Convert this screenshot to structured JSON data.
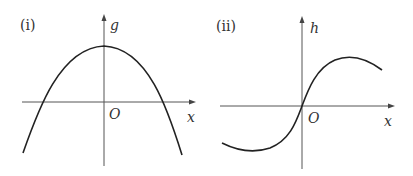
{
  "figures": [
    {
      "id": "i",
      "label": "(i)",
      "y_axis_label": "g",
      "x_axis_label": "x",
      "origin_label": "O",
      "description": "Downward-opening parabola-like curve with maximum on the positive g-axis, crossing the x-axis once on each side of the origin"
    },
    {
      "id": "ii",
      "label": "(ii)",
      "y_axis_label": "h",
      "x_axis_label": "x",
      "origin_label": "O",
      "description": "Odd, sine-like curve passing through the origin with a minimum for x<0 and a maximum for x>0"
    }
  ],
  "colors": {
    "curve": "#222222",
    "axis": "#555555",
    "text": "#333333",
    "background": "#ffffff"
  }
}
